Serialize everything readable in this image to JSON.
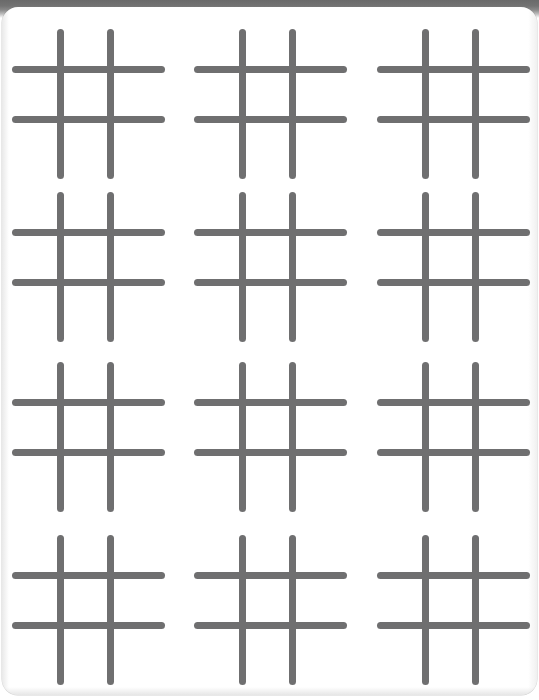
{
  "document": {
    "title": "Tic-Tac-Toe Worksheet",
    "page_kind": "printable-worksheet",
    "sheet_width_px": 539,
    "sheet_height_px": 700,
    "background_color": "#ffffff",
    "scan_edge_color": "#6d6d6d",
    "corner_radius_px": 16
  },
  "grid_style": {
    "line_color": "#6f6f70",
    "line_thickness_px": 7,
    "line_cap": "rounded",
    "cell_size_px": 50
  },
  "layout": {
    "columns": 3,
    "rows": 4,
    "total_grids": 12,
    "column_x": [
      10,
      192,
      375
    ],
    "row_y": [
      22,
      185,
      355,
      528
    ],
    "grid_width_px": 153,
    "grid_height_px": 150
  },
  "grids": [
    {
      "id": "grid-r1-c1",
      "row": 1,
      "column": 1,
      "left": 10,
      "top": 22,
      "label": "tic-tac-toe-board-1"
    },
    {
      "id": "grid-r1-c2",
      "row": 1,
      "column": 2,
      "left": 192,
      "top": 22,
      "label": "tic-tac-toe-board-2"
    },
    {
      "id": "grid-r1-c3",
      "row": 1,
      "column": 3,
      "left": 375,
      "top": 22,
      "label": "tic-tac-toe-board-3"
    },
    {
      "id": "grid-r2-c1",
      "row": 2,
      "column": 1,
      "left": 10,
      "top": 185,
      "label": "tic-tac-toe-board-4"
    },
    {
      "id": "grid-r2-c2",
      "row": 2,
      "column": 2,
      "left": 192,
      "top": 185,
      "label": "tic-tac-toe-board-5"
    },
    {
      "id": "grid-r2-c3",
      "row": 2,
      "column": 3,
      "left": 375,
      "top": 185,
      "label": "tic-tac-toe-board-6"
    },
    {
      "id": "grid-r3-c1",
      "row": 3,
      "column": 1,
      "left": 10,
      "top": 355,
      "label": "tic-tac-toe-board-7"
    },
    {
      "id": "grid-r3-c2",
      "row": 3,
      "column": 2,
      "left": 192,
      "top": 355,
      "label": "tic-tac-toe-board-8"
    },
    {
      "id": "grid-r3-c3",
      "row": 3,
      "column": 3,
      "left": 375,
      "top": 355,
      "label": "tic-tac-toe-board-9"
    },
    {
      "id": "grid-r4-c1",
      "row": 4,
      "column": 1,
      "left": 10,
      "top": 528,
      "label": "tic-tac-toe-board-10"
    },
    {
      "id": "grid-r4-c2",
      "row": 4,
      "column": 2,
      "left": 192,
      "top": 528,
      "label": "tic-tac-toe-board-11"
    },
    {
      "id": "grid-r4-c3",
      "row": 4,
      "column": 3,
      "left": 375,
      "top": 528,
      "label": "tic-tac-toe-board-12"
    }
  ],
  "grid_geometry": {
    "vertical_lines": [
      {
        "name": "vertical-left",
        "x": 48,
        "y": 0,
        "length": 150
      },
      {
        "name": "vertical-right",
        "x": 98,
        "y": 0,
        "length": 150
      }
    ],
    "horizontal_lines": [
      {
        "name": "horizontal-top",
        "x": 0,
        "y": 40,
        "length": 153
      },
      {
        "name": "horizontal-bottom",
        "x": 0,
        "y": 90,
        "length": 153
      }
    ]
  },
  "cells": {
    "count_per_grid": 9,
    "marks": []
  }
}
